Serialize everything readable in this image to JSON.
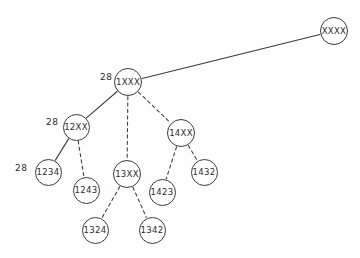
{
  "diagram": {
    "type": "tree",
    "background_color": "#fefefe",
    "stroke_color": "#3a3a3a",
    "text_color": "#2b2b2b",
    "node_radius": 13,
    "nodes": [
      {
        "id": "XXXX",
        "label": "XXXX",
        "x": 334,
        "y": 31,
        "r": 14,
        "font_size": 8.5
      },
      {
        "id": "1XXX",
        "label": "1XXX",
        "x": 128,
        "y": 82,
        "r": 14,
        "font_size": 8.5
      },
      {
        "id": "12XX",
        "label": "12XX",
        "x": 76,
        "y": 127,
        "r": 13.5,
        "font_size": 8.5
      },
      {
        "id": "13XX",
        "label": "13XX",
        "x": 127,
        "y": 174,
        "r": 14,
        "font_size": 8.5
      },
      {
        "id": "14XX",
        "label": "14XX",
        "x": 181,
        "y": 133,
        "r": 14,
        "font_size": 8.5
      },
      {
        "id": "1234",
        "label": "1234",
        "x": 48,
        "y": 172,
        "r": 13.5,
        "font_size": 8.5
      },
      {
        "id": "1243",
        "label": "1243",
        "x": 86,
        "y": 190,
        "r": 13.5,
        "font_size": 8.5
      },
      {
        "id": "1324",
        "label": "1324",
        "x": 95,
        "y": 230,
        "r": 13.5,
        "font_size": 8.5
      },
      {
        "id": "1342",
        "label": "1342",
        "x": 152,
        "y": 230,
        "r": 13.5,
        "font_size": 8.5
      },
      {
        "id": "1423",
        "label": "1423",
        "x": 162,
        "y": 192,
        "r": 13.5,
        "font_size": 8.5
      },
      {
        "id": "1432",
        "label": "1432",
        "x": 204,
        "y": 172,
        "r": 13.5,
        "font_size": 8.5
      }
    ],
    "edges": [
      {
        "from": "XXXX",
        "to": "1XXX",
        "style": "solid"
      },
      {
        "from": "1XXX",
        "to": "12XX",
        "style": "solid"
      },
      {
        "from": "1XXX",
        "to": "13XX",
        "style": "dashed"
      },
      {
        "from": "1XXX",
        "to": "14XX",
        "style": "dashed"
      },
      {
        "from": "12XX",
        "to": "1234",
        "style": "solid"
      },
      {
        "from": "12XX",
        "to": "1243",
        "style": "dashed"
      },
      {
        "from": "13XX",
        "to": "1324",
        "style": "dashed"
      },
      {
        "from": "13XX",
        "to": "1342",
        "style": "dashed"
      },
      {
        "from": "14XX",
        "to": "1423",
        "style": "dashed"
      },
      {
        "from": "14XX",
        "to": "1432",
        "style": "dashed"
      }
    ],
    "cost_labels": [
      {
        "id": "cost-1xxx",
        "text": "28",
        "x": 100,
        "y": 72,
        "font_size": 9
      },
      {
        "id": "cost-12xx",
        "text": "28",
        "x": 46,
        "y": 117,
        "font_size": 9
      },
      {
        "id": "cost-1234",
        "text": "28",
        "x": 15,
        "y": 163,
        "font_size": 9
      }
    ]
  }
}
